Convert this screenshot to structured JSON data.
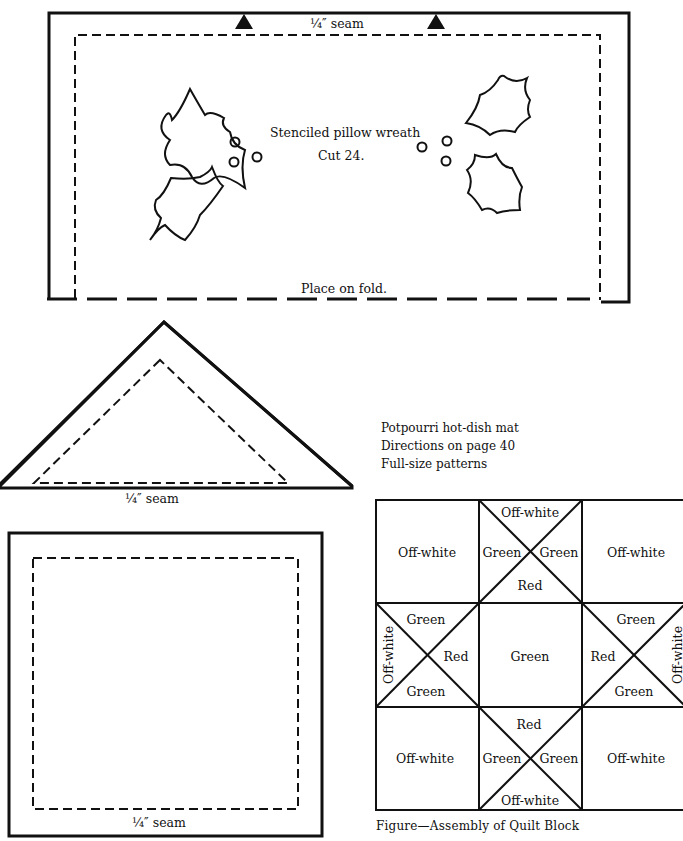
{
  "pillow_pattern": {
    "seam_label": "¼″ seam",
    "title": "Stenciled pillow wreath",
    "cut_note": "Cut 24.",
    "fold_note": "Place on fold.",
    "notch_icons": [
      "triangle-notch",
      "triangle-notch"
    ]
  },
  "triangle_pattern": {
    "seam_label": "¼″ seam"
  },
  "square_pattern": {
    "seam_label": "¼″ seam"
  },
  "info": {
    "line1": "Potpourri hot-dish mat",
    "line2": "Directions on page 40",
    "line3": "Full-size patterns"
  },
  "quilt_block": {
    "caption": "Figure—Assembly of Quilt Block",
    "top_left": "Off-white",
    "top_mid": {
      "top": "Off-white",
      "left": "Green",
      "right": "Green",
      "bottom": "Red"
    },
    "top_right": "Off-white",
    "mid_left": {
      "top": "Green",
      "left": "Off-white",
      "right": "Red",
      "bottom": "Green"
    },
    "center": "Green",
    "mid_right": {
      "top": "Green",
      "left": "Red",
      "right": "Off-white",
      "bottom": "Green"
    },
    "bottom_left": "Off-white",
    "bottom_mid": {
      "top": "Red",
      "left": "Green",
      "right": "Green",
      "bottom": "Off-white"
    },
    "bottom_right": "Off-white"
  }
}
